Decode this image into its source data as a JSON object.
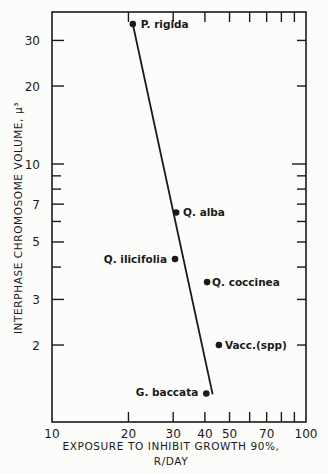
{
  "chart_data": {
    "type": "scatter",
    "title": "",
    "xlabel": "EXPOSURE TO INHIBIT GROWTH 90%, R/DAY",
    "xlabel_lines": [
      "EXPOSURE TO INHIBIT GROWTH 90%,",
      "R/DAY"
    ],
    "ylabel": "INTERPHASE CHROMOSOME VOLUME, μ³",
    "xscale": "log",
    "yscale": "log",
    "xlim": [
      10,
      100
    ],
    "ylim": [
      1.2,
      40
    ],
    "x_ticks": [
      10,
      20,
      30,
      40,
      50,
      60,
      70,
      80,
      90,
      100
    ],
    "x_tick_labels": [
      "10",
      "20",
      "30",
      "40",
      "50",
      "",
      "70",
      "",
      "",
      "100"
    ],
    "y_ticks": [
      2,
      3,
      4,
      5,
      6,
      7,
      8,
      9,
      10,
      20,
      30
    ],
    "y_tick_labels": [
      "2",
      "3",
      "",
      "5",
      "",
      "7",
      "",
      "",
      "10",
      "20",
      "30"
    ],
    "grid": false,
    "legend": null,
    "points": [
      {
        "label": "P. rigida",
        "x": 20.8,
        "y": 34.7
      },
      {
        "label": "Q. alba",
        "x": 30.8,
        "y": 6.5
      },
      {
        "label": "Q. ilicifolia",
        "x": 30.5,
        "y": 4.3
      },
      {
        "label": "Q. coccinea",
        "x": 40.8,
        "y": 3.5
      },
      {
        "label": "Vacc.(spp)",
        "x": 45.4,
        "y": 2.0
      },
      {
        "label": "G. baccata",
        "x": 40.5,
        "y": 1.3
      }
    ],
    "fit_line": {
      "x": [
        20.8,
        42.9
      ],
      "y": [
        34.7,
        1.29
      ]
    }
  }
}
